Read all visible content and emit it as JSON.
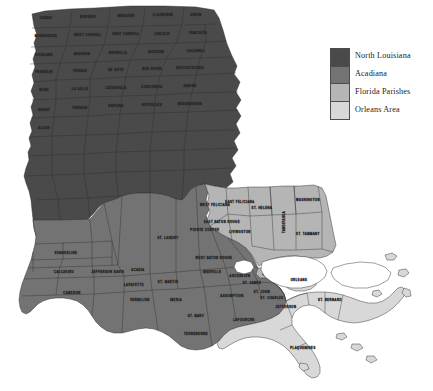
{
  "figure": {
    "kind": "choropleth-map",
    "background_color": "#ffffff",
    "water_color": "#ffffff",
    "border_color": "#2b2b2b"
  },
  "legend": {
    "name": "region-legend",
    "items": [
      {
        "label": "North Louisiana",
        "color": "#4a4a4a"
      },
      {
        "label": "Acadiana",
        "color": "#737373"
      },
      {
        "label": "Florida Parishes",
        "color": "#b5b5b5"
      },
      {
        "label": "Orleans Area",
        "color": "#d8d8d8"
      }
    ]
  },
  "regions": [
    {
      "key": "north_louisiana",
      "label": "North Louisiana",
      "color": "#4a4a4a"
    },
    {
      "key": "acadiana",
      "label": "Acadiana",
      "color": "#737373"
    },
    {
      "key": "florida_parishes",
      "label": "Florida Parishes",
      "color": "#b5b5b5"
    },
    {
      "key": "orleans_area",
      "label": "Orleans Area",
      "color": "#d8d8d8"
    }
  ],
  "parish_labels": {
    "north_louisiana": [
      "CADDO",
      "BOSSIER",
      "WEBSTER",
      "CLAIBORNE",
      "UNION",
      "MOREHOUSE",
      "WEST CARROLL",
      "EAST CARROLL",
      "LINCOLN",
      "OUACHITA",
      "RICHLAND",
      "MADISON",
      "BIENVILLE",
      "JACKSON",
      "CALDWELL",
      "FRANKLIN",
      "TENSAS",
      "DE SOTO",
      "RED RIVER",
      "NATCHITOCHES",
      "WINN",
      "LA SALLE",
      "CATAHOULA",
      "CONCORDIA",
      "SABINE",
      "GRANT",
      "VERNON",
      "RAPIDES",
      "AVOYELLES",
      "BEAUREGARD",
      "ALLEN"
    ],
    "acadiana": [
      "EVANGELINE",
      "ST. LANDRY",
      "POINTE COUPEE",
      "CALCASIEU",
      "JEFFERSON DAVIS",
      "ACADIA",
      "LAFAYETTE",
      "ST. MARTIN",
      "IBERIA",
      "IBERVILLE",
      "WEST BATON ROUGE",
      "ASSUMPTION",
      "ST. JAMES",
      "ST. MARY",
      "CAMERON",
      "VERMILION",
      "TERREBONNE",
      "LAFOURCHE",
      "ST. JOHN",
      "ASCENSION"
    ],
    "florida_parishes": [
      "WEST FELICIANA",
      "EAST FELICIANA",
      "ST. HELENA",
      "WASHINGTON",
      "TANGIPAHOA",
      "LIVINGSTON",
      "ST. TAMMANY",
      "EAST BATON ROUGE"
    ],
    "orleans_area": [
      "ORLEANS",
      "ST. BERNARD",
      "JEFFERSON",
      "PLAQUEMINES",
      "ST. CHARLES"
    ]
  }
}
